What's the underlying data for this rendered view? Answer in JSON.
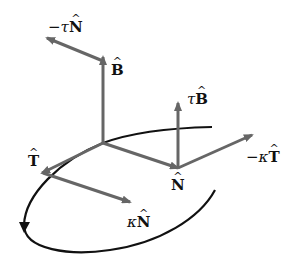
{
  "diagram": {
    "colors": {
      "arrow": "#666666",
      "curve": "#111111",
      "text": "#111111"
    },
    "labels": {
      "B": {
        "coef": "",
        "vec": "B",
        "hat": "^"
      },
      "minus_tau_N": {
        "coef": "−τ",
        "vec": "N",
        "hat": "^"
      },
      "tau_B": {
        "coef": "τ",
        "vec": "B",
        "hat": "^"
      },
      "minus_kappa_T": {
        "coef": "−κ",
        "vec": "T",
        "hat": "^"
      },
      "N": {
        "coef": "",
        "vec": "N",
        "hat": "^"
      },
      "T": {
        "coef": "",
        "vec": "T",
        "hat": "^"
      },
      "kappa_N": {
        "coef": "κ",
        "vec": "N",
        "hat": "^"
      }
    },
    "arrows": [
      {
        "name": "B",
        "from": [
          103,
          143
        ],
        "to": [
          103,
          57
        ]
      },
      {
        "name": "-tauN",
        "from": [
          103,
          60
        ],
        "to": [
          47,
          38
        ]
      },
      {
        "name": "N",
        "from": [
          103,
          143
        ],
        "to": [
          178,
          168
        ]
      },
      {
        "name": "tauB",
        "from": [
          178,
          168
        ],
        "to": [
          178,
          103
        ]
      },
      {
        "name": "-kappaT",
        "from": [
          178,
          168
        ],
        "to": [
          252,
          135
        ]
      },
      {
        "name": "T",
        "from": [
          103,
          143
        ],
        "to": [
          42,
          173
        ]
      },
      {
        "name": "kappaN",
        "from": [
          42,
          173
        ],
        "to": [
          130,
          202
        ]
      }
    ]
  }
}
